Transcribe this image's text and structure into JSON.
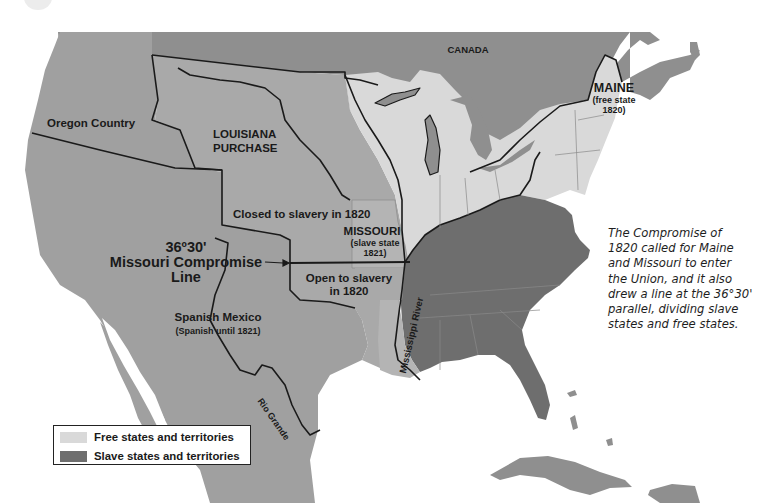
{
  "map": {
    "title": "Missouri Compromise of 1820",
    "colors": {
      "background": "#ffffff",
      "foreign_land": "#8f8f8f",
      "territory": "#a9a9a9",
      "free": "#d9d9d9",
      "slave": "#6e6e6e",
      "boundary": "#1a1a1a",
      "state_line": "#8a8a8a"
    },
    "labels": {
      "canada": "CANADA",
      "maine": "MAINE",
      "maine_note_1": "(free state",
      "maine_note_2": "1820)",
      "oregon": "Oregon Country",
      "louisiana_1": "LOUISIANA",
      "louisiana_2": "PURCHASE",
      "closed": "Closed to slavery in 1820",
      "missouri": "MISSOURI",
      "missouri_note_1": "(slave state",
      "missouri_note_2": "1821)",
      "line_deg": "36º30'",
      "line_name": "Missouri Compromise",
      "line_word": "Line",
      "open_1": "Open to slavery",
      "open_2": "in 1820",
      "mexico": "Spanish Mexico",
      "mexico_note": "(Spanish until 1821)",
      "rio_grande": "Rio Grande",
      "mississippi": "Mississippi River"
    },
    "legend": {
      "items": [
        {
          "label": "Free states and territories",
          "color": "#d9d9d9"
        },
        {
          "label": "Slave states and territories",
          "color": "#6e6e6e"
        }
      ]
    },
    "caption": {
      "lines": [
        "The Compromise of",
        "1820 called for Maine",
        "and Missouri to enter",
        "the Union, and it also",
        "drew a line at the 36°30'",
        "parallel, dividing slave",
        "states and free states."
      ]
    }
  }
}
